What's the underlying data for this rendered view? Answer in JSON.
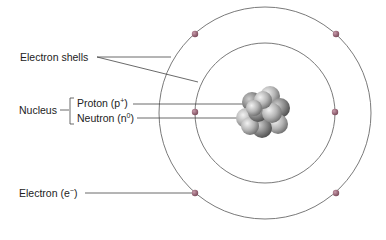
{
  "diagram": {
    "type": "atom-model",
    "labels": {
      "electron_shells": "Electron shells",
      "nucleus": "Nucleus",
      "proton": "Proton (p",
      "proton_sup": "+",
      "proton_close": ")",
      "neutron": "Neutron (n",
      "neutron_sup": "0",
      "neutron_close": ")",
      "electron": "Electron (e",
      "electron_sup": "−",
      "electron_close": ")"
    },
    "shells": [
      {
        "name": "inner-shell",
        "radius": 70,
        "electrons": 2
      },
      {
        "name": "outer-shell",
        "radius": 106,
        "electrons": 4
      }
    ],
    "colors": {
      "shell": "#7a7a7a",
      "electron": "#9a6a7a",
      "leader": "#444444",
      "nucleus": "#9a9a9a"
    }
  }
}
